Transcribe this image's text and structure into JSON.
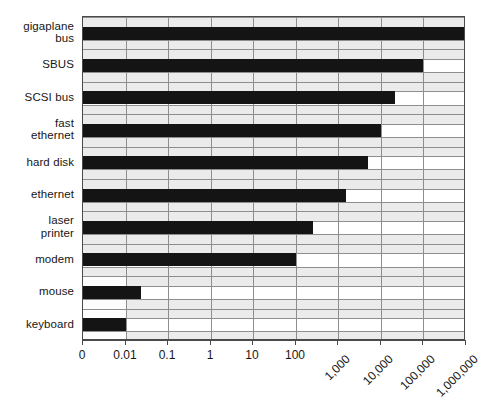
{
  "chart_data": {
    "type": "bar",
    "orientation": "horizontal",
    "title": "",
    "subtitle": "",
    "xlabel": "",
    "ylabel": "",
    "xscale": "log-broken",
    "grid": true,
    "legend": null,
    "categories": [
      "gigaplane bus",
      "SBUS",
      "SCSI bus",
      "fast ethernet",
      "hard disk",
      "ethernet",
      "laser printer",
      "modem",
      "mouse",
      "keyboard"
    ],
    "category_lines": [
      [
        "gigaplane",
        "bus"
      ],
      [
        "SBUS"
      ],
      [
        "SCSI bus"
      ],
      [
        "fast",
        "ethernet"
      ],
      [
        "hard disk"
      ],
      [
        "ethernet"
      ],
      [
        "laser",
        "printer"
      ],
      [
        "modem"
      ],
      [
        "mouse"
      ],
      [
        "keyboard"
      ]
    ],
    "values": [
      4000000,
      100000,
      20000,
      10000,
      5000,
      1500,
      250,
      100,
      0.03,
      0.01
    ],
    "value_positions": [
      10.0,
      8.0,
      7.32,
      7.0,
      6.7,
      6.18,
      5.4,
      5.0,
      1.36,
      1.0
    ],
    "xticks": [
      0,
      0.01,
      0.1,
      1,
      10,
      100,
      1000,
      10000,
      100000,
      1000000
    ],
    "xtick_labels": [
      "0",
      "0.01",
      "0.1",
      "1",
      "10",
      "100",
      "1,000",
      "10,000",
      "100,000",
      "1,000,000"
    ],
    "xtick_rotated": [
      false,
      false,
      false,
      false,
      false,
      false,
      true,
      true,
      true,
      true
    ],
    "xlim": [
      0,
      10
    ],
    "colors": {
      "bar": "#141414",
      "panel_fill": "#ebebeb",
      "panel_white": "#fdfdfd",
      "gridline": "#8e8e8e",
      "frame": "#4a4a4a",
      "text": "#161616"
    }
  }
}
